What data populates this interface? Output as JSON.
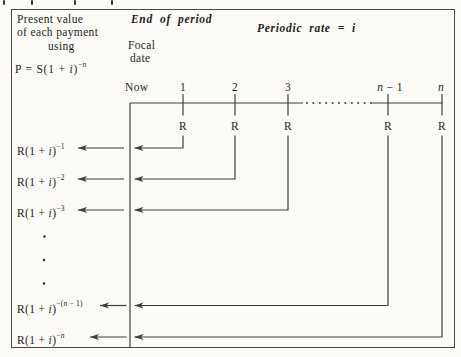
{
  "colors": {
    "background": "#fcfbf7",
    "ink": "#1e1e1e",
    "line": "#3e3e3c",
    "border": "#4a4a48"
  },
  "header": {
    "pv_line1": "Present value",
    "pv_line2": "of each payment",
    "pv_line3": "using",
    "formula": {
      "base": "P = S(1 + ",
      "var": "i",
      "close": ")",
      "sup_pre": "−",
      "sup_var": "n"
    },
    "end_of_period": "End of period",
    "focal_line1": "Focal",
    "focal_line2": "date",
    "periodic_rate": "Periodic rate = i"
  },
  "timeline": {
    "now": "Now",
    "ticks": [
      {
        "pre": "1",
        "var": "",
        "post": ""
      },
      {
        "pre": "2",
        "var": "",
        "post": ""
      },
      {
        "pre": "3",
        "var": "",
        "post": ""
      },
      {
        "pre": "",
        "var": "n",
        "post": " − 1"
      },
      {
        "pre": "",
        "var": "n",
        "post": ""
      }
    ],
    "payment": "R"
  },
  "rows": [
    {
      "base": "R(1 + ",
      "var": "i",
      "close": ")",
      "sup_pre": "−1",
      "sup_var": "",
      "sup_post": ""
    },
    {
      "base": "R(1 + ",
      "var": "i",
      "close": ")",
      "sup_pre": "−2",
      "sup_var": "",
      "sup_post": ""
    },
    {
      "base": "R(1 + ",
      "var": "i",
      "close": ")",
      "sup_pre": "−3",
      "sup_var": "",
      "sup_post": ""
    },
    {
      "base": "R(1 + ",
      "var": "i",
      "close": ")",
      "sup_pre": "−(",
      "sup_var": "n",
      "sup_post": " − 1)"
    },
    {
      "base": "R(1 + ",
      "var": "i",
      "close": ")",
      "sup_pre": "−",
      "sup_var": "n",
      "sup_post": ""
    }
  ]
}
